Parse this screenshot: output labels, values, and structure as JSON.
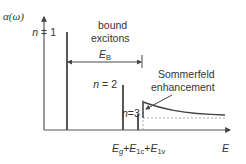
{
  "diagram": {
    "type": "exciton absorption spectrum",
    "y_axis_label": "α(ω)",
    "x_axis_label": "E",
    "lines": [
      {
        "label": "n = 1"
      },
      {
        "label": "n = 2"
      },
      {
        "label": "n=3"
      }
    ],
    "annotations": {
      "bound_excitons_line1": "bound",
      "bound_excitons_line2": "excitons",
      "binding_energy": "E",
      "binding_energy_sub": "B",
      "sommerfeld_line1": "Sommerfeld",
      "sommerfeld_line2": "enhancement"
    },
    "gap_label": {
      "e_g": "E",
      "e_g_sub": "g",
      "plus1": "+",
      "e_1c": "E",
      "e_1c_sub": "1c",
      "plus2": "+",
      "e_1v": "E",
      "e_1v_sub": "1v"
    },
    "colors": {
      "axis": "#555555",
      "line": "#444444",
      "dashed": "#aaaaaa",
      "text": "#333333"
    }
  }
}
